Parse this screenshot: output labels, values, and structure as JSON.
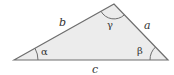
{
  "diagram": {
    "type": "triangle",
    "colors": {
      "fill": "#ececec",
      "stroke": "#6e6e6e",
      "label": "#333333",
      "background": "#ffffff"
    },
    "vertices": {
      "left": [
        14,
        60
      ],
      "apex": [
        114,
        4
      ],
      "right": [
        168,
        60
      ]
    },
    "sides": {
      "a": "a",
      "b": "b",
      "c": "c"
    },
    "angles": {
      "alpha": "α",
      "beta": "β",
      "gamma": "γ"
    }
  }
}
